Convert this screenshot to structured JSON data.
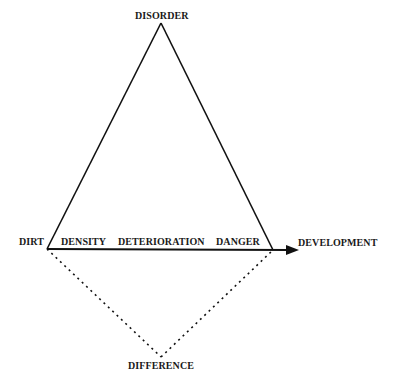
{
  "diagram": {
    "nodes": {
      "top": "DISORDER",
      "left": "DIRT",
      "right_arrow_target": "DEVELOPMENT",
      "bottom": "DIFFERENCE"
    },
    "baseline_labels": [
      "DENSITY",
      "DETERIORATION",
      "DANGER"
    ],
    "edges": [
      {
        "from": "DIRT",
        "to": "DISORDER",
        "style": "solid"
      },
      {
        "from": "DISORDER",
        "to": "DANGER-vertex",
        "style": "solid"
      },
      {
        "from": "DIRT",
        "to": "DEVELOPMENT",
        "style": "solid-arrow"
      },
      {
        "from": "DIRT",
        "to": "DIFFERENCE",
        "style": "dotted"
      },
      {
        "from": "DIFFERENCE",
        "to": "DANGER-vertex",
        "style": "dotted"
      }
    ],
    "colors": {
      "line": "#111111",
      "text": "#1a1a1a",
      "background": "#ffffff"
    }
  }
}
